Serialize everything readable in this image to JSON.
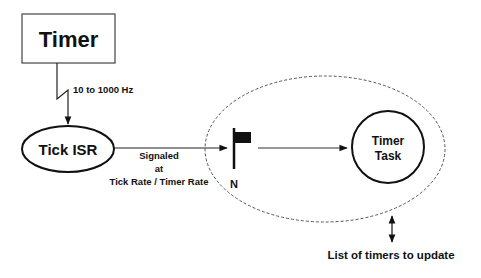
{
  "diagram": {
    "timer_box": {
      "label": "Timer"
    },
    "frequency_label": "10 to 1000 Hz",
    "tick_isr": {
      "label": "Tick ISR"
    },
    "signal_label": {
      "line1": "Signaled",
      "line2": "at",
      "line3": "Tick Rate / Timer Rate"
    },
    "semaphore_flag": {
      "label": "N",
      "icon": "flag-icon"
    },
    "timer_task": {
      "line1": "Timer",
      "line2": "Task"
    },
    "timer_list_label": "List of timers to update",
    "colors": {
      "stroke": "#111111",
      "dashed": "#555555",
      "background": "#ffffff"
    }
  }
}
